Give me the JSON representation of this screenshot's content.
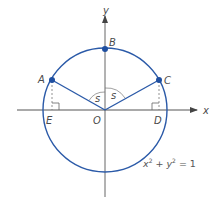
{
  "diagram": {
    "type": "unit-circle",
    "colors": {
      "circle": "#2b5aa8",
      "segments": "#2b5aa8",
      "points": "#1f4fa0",
      "axes": "#555555",
      "dashed": "#777777",
      "text": "#4a4a4a"
    },
    "axes": {
      "x_label": "x",
      "y_label": "y"
    },
    "points": {
      "A": "A",
      "B": "B",
      "C": "C",
      "D": "D",
      "E": "E",
      "O": "O"
    },
    "angles": {
      "left": "s",
      "right": "s"
    },
    "equation": {
      "x": "x",
      "x_exp": "2",
      "plus": "+",
      "y": "y",
      "y_exp": "2",
      "equals": "=",
      "rhs": "1"
    }
  }
}
